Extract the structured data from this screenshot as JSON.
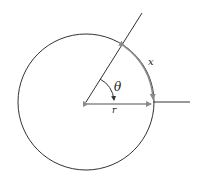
{
  "diagram": {
    "title": "",
    "labels": {
      "arc_length": "x",
      "angle": "θ",
      "radius": "r"
    },
    "colors": {
      "line": "#333333",
      "arrow": "#8a8a8a",
      "background": "#ffffff"
    },
    "geometry": {
      "circle_center": [
        86,
        102
      ],
      "circle_radius": 68,
      "ray_end": [
        142,
        13
      ],
      "horizontal_ray_end": [
        190,
        102
      ]
    }
  }
}
